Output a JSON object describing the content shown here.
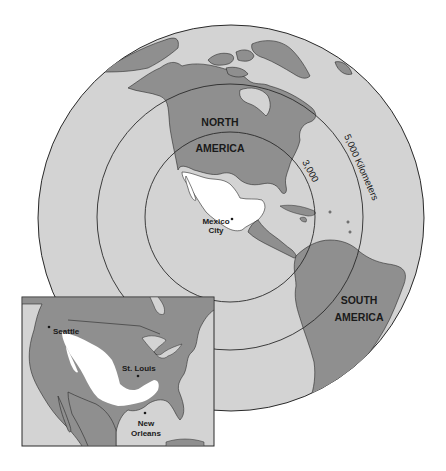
{
  "map": {
    "regions": {
      "north_america": [
        "NORTH",
        "AMERICA"
      ],
      "south_america": [
        "SOUTH",
        "AMERICA"
      ]
    },
    "cities": {
      "mexico_city": [
        "Mexico",
        "City"
      ]
    },
    "rings": {
      "inner_label": "3,000",
      "outer_label": "5,000 Kilometers"
    },
    "colors": {
      "ocean": "#d3d3d3",
      "land": "#8f8f8f",
      "highlight": "#ffffff",
      "line": "#2a2a2a",
      "background": "#ffffff"
    }
  },
  "inset": {
    "cities": {
      "seattle": "Seattle",
      "st_louis": "St. Louis",
      "new_orleans": [
        "New",
        "Orleans"
      ]
    }
  }
}
